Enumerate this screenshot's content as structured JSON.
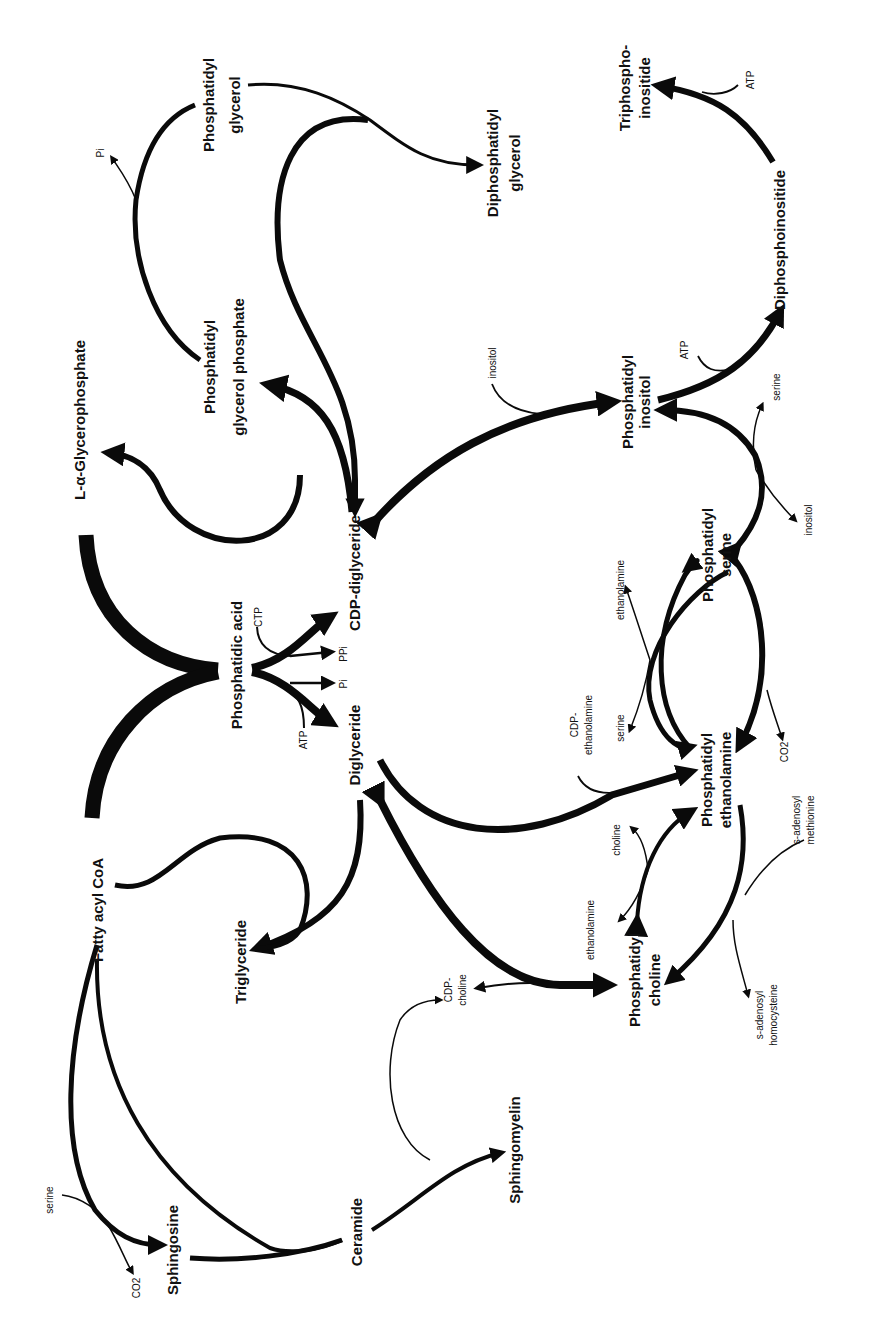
{
  "diagram": {
    "orientation": "rotated 90° counter-clockwise (text reads bottom-to-top)",
    "nodes": {
      "fatty_acyl_coa": "Fatty acyl CoA",
      "glycerophosphate": "L-α-Glycerophosphate",
      "phosphatidic_acid": "Phosphatidic acid",
      "cdp_diglyceride": "CDP-diglyceride",
      "diglyceride": "Diglyceride",
      "triglyceride": "Triglyceride",
      "pgp_line1": "Phosphatidyl",
      "pgp_line2": "glycerol phosphate",
      "pg_line1": "Phosphatidyl",
      "pg_line2": "glycerol",
      "dpg_line1": "Diphosphatidyl",
      "dpg_line2": "glycerol",
      "pi_line1": "Phosphatidyl",
      "pi_line2": "inositol",
      "dpi": "Diphosphoinositide",
      "tpi_line1": "Triphospho-",
      "tpi_line2": "inositide",
      "ps_line1": "Phosphatidyl",
      "ps_line2": "serine",
      "pe_line1": "Phosphatidyl",
      "pe_line2": "ethanolamine",
      "pc_line1": "Phosphatidyl",
      "pc_line2": "choline",
      "sphingosine": "Sphingosine",
      "ceramide": "Ceramide",
      "sphingomyelin": "Sphingomyelin"
    },
    "cofactors": {
      "pi_release_pgp": "Pi",
      "ctp": "CTP",
      "ppi": "PPi",
      "pi_release_pa": "Pi",
      "atp_pa": "ATP",
      "inositol_in": "inositol",
      "atp_pi": "ATP",
      "atp_dpi": "ATP",
      "serine_out_pi": "serine",
      "inositol_ps": "inositol",
      "ethanolamine_out_ps": "ethanolamine",
      "serine_in_pe": "serine",
      "cdp_eth_line1": "CDP-",
      "cdp_eth_line2": "ethanolamine",
      "co2_ps": "CO2",
      "choline_in": "choline",
      "ethanolamine_out_pc": "ethanolamine",
      "sam_line1": "s-adenosyl",
      "sam_line2": "methionine",
      "sah_line1": "s-adenosyl",
      "sah_line2": "homocysteine",
      "cdp_cho_line1": "CDP-",
      "cdp_cho_line2": "choline",
      "serine_sph": "serine",
      "co2_sph": "CO2"
    },
    "edges": [
      {
        "from": "Fatty acyl CoA",
        "to": "Phosphatidic acid",
        "weight": "heaviest"
      },
      {
        "from": "L-α-Glycerophosphate",
        "to": "Phosphatidic acid",
        "weight": "heaviest"
      },
      {
        "from": "Phosphatidic acid",
        "to": "CDP-diglyceride",
        "cofactors_in": [
          "CTP"
        ],
        "cofactors_out": [
          "PPi"
        ]
      },
      {
        "from": "Phosphatidic acid",
        "to": "Diglyceride",
        "cofactors_in": [
          "ATP"
        ],
        "cofactors_out": [
          "Pi"
        ]
      },
      {
        "from": "CDP-diglyceride",
        "to": "L-α-Glycerophosphate"
      },
      {
        "from": "CDP-diglyceride",
        "to": "Phosphatidyl glycerol phosphate"
      },
      {
        "from": "Phosphatidyl glycerol phosphate",
        "to": "Phosphatidyl glycerol",
        "cofactors_out": [
          "Pi"
        ]
      },
      {
        "from": "Phosphatidyl glycerol",
        "to": "Diphosphatidyl glycerol"
      },
      {
        "from": "Phosphatidyl glycerol",
        "to": "CDP-diglyceride"
      },
      {
        "from": "CDP-diglyceride",
        "to": "Phosphatidyl inositol",
        "cofactors_in": [
          "inositol"
        ],
        "bidirectional": true
      },
      {
        "from": "Phosphatidyl inositol",
        "to": "Diphosphoinositide",
        "cofactors_in": [
          "ATP"
        ]
      },
      {
        "from": "Diphosphoinositide",
        "to": "Triphosphoinositide",
        "cofactors_in": [
          "ATP"
        ]
      },
      {
        "from": "Phosphatidyl serine",
        "to": "Phosphatidyl inositol",
        "cofactors": [
          "serine",
          "inositol"
        ],
        "bidirectional": true
      },
      {
        "from": "Phosphatidyl ethanolamine",
        "to": "Phosphatidyl serine",
        "cofactors": [
          "ethanolamine",
          "serine"
        ]
      },
      {
        "from": "Phosphatidyl serine",
        "to": "Phosphatidyl ethanolamine",
        "cofactors_out": [
          "CO2"
        ]
      },
      {
        "from": "Diglyceride",
        "to": "Phosphatidyl ethanolamine",
        "cofactors_in": [
          "CDP-ethanolamine"
        ]
      },
      {
        "from": "Phosphatidyl choline",
        "to": "Phosphatidyl ethanolamine",
        "cofactors": [
          "choline",
          "ethanolamine"
        ],
        "bidirectional": true
      },
      {
        "from": "Phosphatidyl ethanolamine",
        "to": "Phosphatidyl choline",
        "cofactors_in": [
          "s-adenosyl methionine"
        ],
        "cofactors_out": [
          "s-adenosyl homocysteine"
        ]
      },
      {
        "from": "Diglyceride",
        "to": "Phosphatidyl choline",
        "cofactors": [
          "CDP-choline"
        ],
        "bidirectional": true
      },
      {
        "from": "Fatty acyl CoA",
        "to": "Triglyceride"
      },
      {
        "from": "Diglyceride",
        "to": "Triglyceride"
      },
      {
        "from": "Fatty acyl CoA",
        "to": "Sphingosine",
        "cofactors_in": [
          "serine"
        ],
        "cofactors_out": [
          "CO2"
        ]
      },
      {
        "from": "Fatty acyl CoA",
        "to": "Ceramide"
      },
      {
        "from": "Sphingosine",
        "to": "Ceramide"
      },
      {
        "from": "Ceramide",
        "to": "Sphingomyelin",
        "cofactors": [
          "CDP-choline"
        ]
      }
    ],
    "colors": {
      "ink": "#0a0a0a",
      "background": "#ffffff"
    }
  }
}
